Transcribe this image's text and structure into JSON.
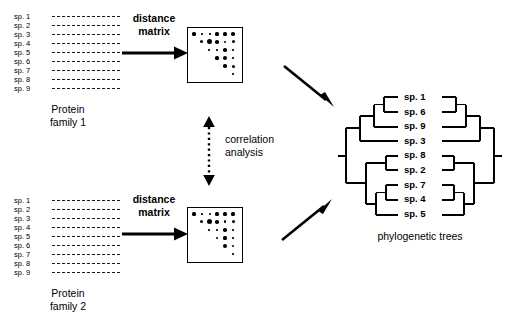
{
  "figure": {
    "panels": {
      "family1": {
        "caption": "Protein\nfamily 1",
        "species": [
          "sp. 1",
          "sp. 2",
          "sp. 3",
          "sp. 4",
          "sp. 5",
          "sp. 6",
          "sp. 7",
          "sp. 8",
          "sp. 9"
        ]
      },
      "family2": {
        "caption": "Protein\nfamily 2",
        "species": [
          "sp. 1",
          "sp. 2",
          "sp. 3",
          "sp. 4",
          "sp. 5",
          "sp. 6",
          "sp. 7",
          "sp. 8",
          "sp. 9"
        ]
      }
    },
    "steps": {
      "distance_matrix_top": "distance\nmatrix",
      "distance_matrix_bottom": "distance\nmatrix",
      "correlation": "correlation\nanalysis"
    },
    "matrices": {
      "top": {
        "rows": 6,
        "cols": 6,
        "cells": [
          {
            "row": 0,
            "col": 0,
            "size": 3.2
          },
          {
            "row": 0,
            "col": 1,
            "size": 1.6
          },
          {
            "row": 0,
            "col": 2,
            "size": 1.6
          },
          {
            "row": 0,
            "col": 3,
            "size": 3.2
          },
          {
            "row": 0,
            "col": 4,
            "size": 3.2
          },
          {
            "row": 0,
            "col": 5,
            "size": 3.6
          },
          {
            "row": 1,
            "col": 1,
            "size": 3.0
          },
          {
            "row": 1,
            "col": 2,
            "size": 5.0
          },
          {
            "row": 1,
            "col": 3,
            "size": 3.6
          },
          {
            "row": 1,
            "col": 4,
            "size": 2.0
          },
          {
            "row": 1,
            "col": 5,
            "size": 3.0
          },
          {
            "row": 2,
            "col": 2,
            "size": 1.4
          },
          {
            "row": 2,
            "col": 3,
            "size": 1.6
          },
          {
            "row": 2,
            "col": 4,
            "size": 3.4
          },
          {
            "row": 2,
            "col": 5,
            "size": 1.6
          },
          {
            "row": 3,
            "col": 3,
            "size": 3.2
          },
          {
            "row": 3,
            "col": 4,
            "size": 4.4
          },
          {
            "row": 3,
            "col": 5,
            "size": 1.6
          },
          {
            "row": 4,
            "col": 4,
            "size": 3.4
          },
          {
            "row": 4,
            "col": 5,
            "size": 3.0
          },
          {
            "row": 5,
            "col": 5,
            "size": 1.6
          }
        ]
      },
      "bottom": {
        "rows": 6,
        "cols": 6,
        "cells": [
          {
            "row": 0,
            "col": 0,
            "size": 3.2
          },
          {
            "row": 0,
            "col": 1,
            "size": 1.6
          },
          {
            "row": 0,
            "col": 2,
            "size": 2.4
          },
          {
            "row": 0,
            "col": 3,
            "size": 3.2
          },
          {
            "row": 0,
            "col": 4,
            "size": 3.2
          },
          {
            "row": 0,
            "col": 5,
            "size": 3.2
          },
          {
            "row": 1,
            "col": 1,
            "size": 3.0
          },
          {
            "row": 1,
            "col": 2,
            "size": 5.0
          },
          {
            "row": 1,
            "col": 3,
            "size": 3.6
          },
          {
            "row": 1,
            "col": 4,
            "size": 2.6
          },
          {
            "row": 1,
            "col": 5,
            "size": 3.0
          },
          {
            "row": 2,
            "col": 2,
            "size": 1.4
          },
          {
            "row": 2,
            "col": 3,
            "size": 1.6
          },
          {
            "row": 2,
            "col": 4,
            "size": 3.4
          },
          {
            "row": 2,
            "col": 5,
            "size": 1.6
          },
          {
            "row": 3,
            "col": 3,
            "size": 2.0
          },
          {
            "row": 3,
            "col": 4,
            "size": 3.2
          },
          {
            "row": 3,
            "col": 5,
            "size": 1.6
          },
          {
            "row": 4,
            "col": 4,
            "size": 4.4
          },
          {
            "row": 4,
            "col": 5,
            "size": 2.4
          },
          {
            "row": 5,
            "col": 5,
            "size": 1.6
          }
        ]
      }
    },
    "trees": {
      "caption": "phylogenetic trees",
      "taxa": [
        "sp. 1",
        "sp. 6",
        "sp. 9",
        "sp. 3",
        "sp. 8",
        "sp. 2",
        "sp. 7",
        "sp. 4",
        "sp. 5"
      ]
    },
    "colors": {
      "ink": "#000000",
      "background": "#ffffff"
    }
  }
}
